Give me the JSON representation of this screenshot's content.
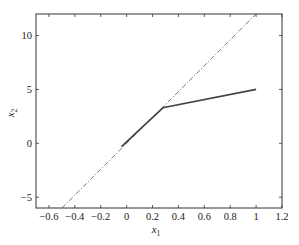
{
  "chart_data": {
    "type": "line",
    "title": "",
    "xlabel": "x1",
    "ylabel": "x2",
    "xlabel_main": "x",
    "xlabel_sub": "1",
    "ylabel_main": "x",
    "ylabel_sub": "2",
    "xlim": [
      -0.7,
      1.2
    ],
    "ylim": [
      -6,
      12
    ],
    "xticks": [
      -0.6,
      -0.4,
      -0.2,
      0,
      0.2,
      0.4,
      0.6,
      0.8,
      1,
      1.2
    ],
    "xtick_labels": [
      "−0.6",
      "−0.4",
      "−0.2",
      "0",
      "0.2",
      "0.4",
      "0.6",
      "0.8",
      "1",
      "1.2"
    ],
    "yticks": [
      -5,
      0,
      5,
      10
    ],
    "ytick_labels": [
      "−5",
      "0",
      "5",
      "10"
    ],
    "grid": false,
    "legend": null,
    "series": [
      {
        "name": "dash-dot line",
        "style": "dashdot",
        "color": "#555555",
        "width": 0.8,
        "x": [
          -0.5,
          1.0
        ],
        "y": [
          -6,
          12
        ]
      },
      {
        "name": "solid piecewise line",
        "style": "solid",
        "color": "#444444",
        "width": 1.6,
        "x": [
          -0.04,
          0.28,
          1.0
        ],
        "y": [
          -0.3,
          3.3,
          5.0
        ]
      }
    ]
  },
  "layout": {
    "plot_left": 36,
    "plot_top": 14,
    "plot_right": 282,
    "plot_bottom": 208,
    "axis_color": "#333333"
  }
}
